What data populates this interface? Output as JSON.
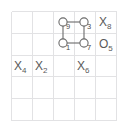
{
  "figure": {
    "kind": "grid-diagram",
    "background_color": "#ffffff",
    "grid": {
      "columns": 5,
      "rows": 5,
      "line_color": "#e2e2e4",
      "left": 11,
      "top": 11,
      "cell_width": 21.2,
      "cell_height": 21.8
    },
    "shape": {
      "name": "square-cycle",
      "stroke_color": "#6b6b6b",
      "node_fill": "#ffffff",
      "node_radius": 4.1,
      "nodes": [
        {
          "id": "n9",
          "label": "9",
          "col": 3,
          "row": 1,
          "cx": 63,
          "cy": 22,
          "label_dx": 4,
          "label_dy": 2
        },
        {
          "id": "n3",
          "label": "3",
          "col": 4,
          "row": 1,
          "cx": 84,
          "cy": 22,
          "label_dx": 4,
          "label_dy": 2
        },
        {
          "id": "n1",
          "label": "1",
          "col": 3,
          "row": 2,
          "cx": 63,
          "cy": 43,
          "label_dx": 4,
          "label_dy": 2
        },
        {
          "id": "n7",
          "label": "7",
          "col": 4,
          "row": 2,
          "cx": 84,
          "cy": 43,
          "label_dx": 4,
          "label_dy": 2
        }
      ],
      "edges": [
        {
          "from": "n9",
          "to": "n3"
        },
        {
          "from": "n3",
          "to": "n7"
        },
        {
          "from": "n7",
          "to": "n1"
        },
        {
          "from": "n1",
          "to": "n9"
        }
      ]
    },
    "cell_labels": [
      {
        "id": "x8",
        "letter": "X",
        "subscript": "8",
        "text": "X8",
        "col": 5,
        "row": 1,
        "x": 99,
        "y": 17
      },
      {
        "id": "o5",
        "letter": "O",
        "subscript": "5",
        "text": "O5",
        "col": 5,
        "row": 2,
        "x": 99,
        "y": 39
      },
      {
        "id": "x4",
        "letter": "X",
        "subscript": "4",
        "text": "X4",
        "col": 1,
        "row": 3,
        "x": 14,
        "y": 61
      },
      {
        "id": "x2",
        "letter": "X",
        "subscript": "2",
        "text": "X2",
        "col": 2,
        "row": 3,
        "x": 35,
        "y": 61
      },
      {
        "id": "x6",
        "letter": "X",
        "subscript": "6",
        "text": "X6",
        "col": 4,
        "row": 3,
        "x": 77,
        "y": 61
      }
    ]
  }
}
